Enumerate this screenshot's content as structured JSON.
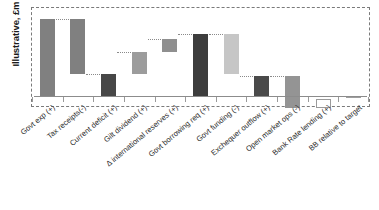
{
  "chart_data": {
    "type": "bar",
    "subtype": "waterfall",
    "title": "",
    "xlabel": "",
    "ylabel": "Illustrative, £m",
    "ylim": [
      -20,
      110
    ],
    "grid": false,
    "legend": null,
    "axis_zero_line": true,
    "plot_border": "dashed",
    "categories": [
      "Govt exp (+)",
      "Tax receipts(-)",
      "Current deficit (+)",
      "Gilt dividend (+)",
      "Δ international reserves (+)",
      "Govt borrowing req (+)",
      "Govt funding (-)",
      "Exchequer outflow (+)",
      "Open market ops (-)",
      "Bank Rate lending (+)",
      "BB relative to target"
    ],
    "bars": [
      {
        "label": "Govt exp (+)",
        "base": 0,
        "top": 100,
        "value": 100,
        "color": "#808080",
        "style": "solid",
        "connector": true
      },
      {
        "label": "Tax receipts(-)",
        "base": 29,
        "top": 100,
        "value": -71,
        "color": "#808080",
        "style": "solid",
        "connector": true
      },
      {
        "label": "Current deficit (+)",
        "base": 0,
        "top": 29,
        "value": 29,
        "color": "#474747",
        "style": "solid",
        "connector": true
      },
      {
        "label": "Gilt dividend (+)",
        "base": 29,
        "top": 58,
        "value": 29,
        "color": "#9c9c9c",
        "style": "solid",
        "connector": true
      },
      {
        "label": "Δ international reserves (+)",
        "base": 58,
        "top": 75,
        "value": 17,
        "color": "#8f8f8f",
        "style": "solid",
        "connector": true
      },
      {
        "label": "Govt borrowing req (+)",
        "base": 0,
        "top": 81,
        "value": 81,
        "color": "#3d3d3d",
        "style": "solid",
        "connector": true
      },
      {
        "label": "Govt funding (-)",
        "base": 29,
        "top": 81,
        "value": -52,
        "color": "#c6c6c6",
        "style": "solid",
        "connector": true
      },
      {
        "label": "Exchequer outflow (+)",
        "base": 0,
        "top": 27,
        "value": 27,
        "color": "#4a4a4a",
        "style": "solid",
        "connector": true
      },
      {
        "label": "Open market ops (-)",
        "base": -14,
        "top": 27,
        "value": -41,
        "color": "#949494",
        "style": "solid",
        "connector": false
      },
      {
        "label": "Bank Rate lending (+)",
        "base": -14,
        "top": -3,
        "value": 11,
        "color": "#ffffff",
        "style": "hollow",
        "connector": false
      },
      {
        "label": "BB relative to target",
        "base": -1,
        "top": 1,
        "value": 0,
        "color": "#9e9e9e",
        "style": "solid",
        "connector": false
      }
    ],
    "colors": {
      "bar_dark": "#3d3d3d",
      "bar_medium": "#808080",
      "bar_light": "#c6c6c6",
      "bar_hollow_stroke": "#9a9a9a",
      "axis": "#8c8c8c",
      "connector": "#8a8a8a",
      "frame": "#7a7a7a",
      "text": "#2b2b2b"
    }
  }
}
